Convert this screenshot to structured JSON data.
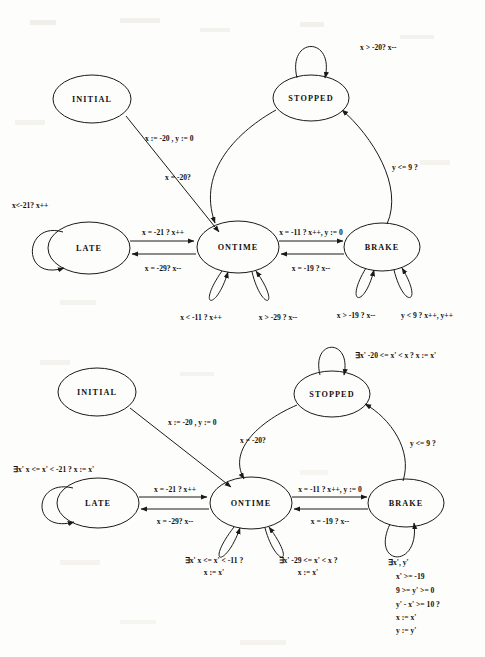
{
  "page": {
    "background_color": "#fdfdfb",
    "ink_color": "#1a1a1a"
  },
  "diagrams": [
    {
      "id": "top-diagram",
      "name": "concrete-timed-automaton",
      "states": [
        {
          "id": "initial",
          "label": "INITIAL",
          "cx": 92,
          "cy": 99,
          "rx": 39,
          "ry": 24
        },
        {
          "id": "stopped",
          "label": "STOPPED",
          "cx": 311,
          "cy": 98,
          "rx": 38,
          "ry": 23
        },
        {
          "id": "late",
          "label": "LATE",
          "cx": 89,
          "cy": 248,
          "rx": 41,
          "ry": 26
        },
        {
          "id": "ontime",
          "label": "ONTIME",
          "cx": 238,
          "cy": 247,
          "rx": 41,
          "ry": 26
        },
        {
          "id": "brake",
          "label": "BRAKE",
          "cx": 382,
          "cy": 247,
          "rx": 38,
          "ry": 24
        }
      ],
      "transitions": [
        {
          "id": "initial-to-ontime",
          "label": "x := -20 , y := 0",
          "lx": 187,
          "ly": 137
        },
        {
          "id": "ontime-to-stopped",
          "label": "x = -20?",
          "lx": 186,
          "ly": 177
        },
        {
          "id": "brake-to-stopped",
          "label": "y <= 9 ?",
          "lx": 403,
          "ly": 166
        },
        {
          "id": "stopped-self",
          "label": "x > -20? x--",
          "lx": 360,
          "ly": 50
        },
        {
          "id": "late-to-ontime",
          "label": "x = -21 ? x++",
          "lx": 165,
          "ly": 232
        },
        {
          "id": "ontime-to-late",
          "label": "x = -29? x--",
          "lx": 165,
          "ly": 268
        },
        {
          "id": "ontime-to-brake",
          "label": "x = -11 ? x++, y := 0",
          "lx": 310,
          "ly": 235
        },
        {
          "id": "brake-to-ontime",
          "label": "x = -19 ? x--",
          "lx": 310,
          "ly": 268
        },
        {
          "id": "late-self",
          "label": "x<-21?  x++",
          "lx": 12,
          "ly": 206
        },
        {
          "id": "ontime-self-left",
          "label": "x < -11 ? x++",
          "lx": 200,
          "ly": 318
        },
        {
          "id": "ontime-self-right",
          "label": "x > -29 ? x--",
          "lx": 277,
          "ly": 318
        },
        {
          "id": "brake-self-left",
          "label": "x > -19 ? x--",
          "lx": 355,
          "ly": 316
        },
        {
          "id": "brake-self-right",
          "label": "y < 9 ? x++, y++",
          "lx": 425,
          "ly": 316
        }
      ]
    },
    {
      "id": "bottom-diagram",
      "name": "abstract-timed-automaton",
      "states": [
        {
          "id": "initial",
          "label": "INITIAL",
          "cx": 97,
          "cy": 392,
          "rx": 39,
          "ry": 24
        },
        {
          "id": "stopped",
          "label": "STOPPED",
          "cx": 332,
          "cy": 394,
          "rx": 38,
          "ry": 23
        },
        {
          "id": "late",
          "label": "LATE",
          "cx": 98,
          "cy": 503,
          "rx": 41,
          "ry": 25
        },
        {
          "id": "ontime",
          "label": "ONTIME",
          "cx": 251,
          "cy": 503,
          "rx": 41,
          "ry": 26
        },
        {
          "id": "brake",
          "label": "BRAKE",
          "cx": 406,
          "cy": 503,
          "rx": 38,
          "ry": 24
        }
      ],
      "transitions": [
        {
          "id": "initial-to-ontime",
          "label": "x := -20 , y := 0",
          "lx": 200,
          "ly": 423
        },
        {
          "id": "ontime-to-stopped",
          "label": "x = -20?",
          "lx": 196,
          "ly": 441
        },
        {
          "id": "brake-to-stopped",
          "label": "y <= 9 ?",
          "lx": 428,
          "ly": 444
        },
        {
          "id": "stopped-self",
          "label": "∃x'  -20 <= x' < x ?  x := x'",
          "lx": 397,
          "ly": 357
        },
        {
          "id": "late-to-ontime",
          "label": "x = -21 ? x++",
          "lx": 177,
          "ly": 491
        },
        {
          "id": "ontime-to-late",
          "label": "x = -29? x--",
          "lx": 177,
          "ly": 522
        },
        {
          "id": "ontime-to-brake",
          "label": "x = -11 ? x++, y := 0",
          "lx": 329,
          "ly": 492
        },
        {
          "id": "brake-to-ontime",
          "label": "x = -19 ? x--",
          "lx": 329,
          "ly": 522
        },
        {
          "id": "late-self",
          "label": "∃x'  x <= x' < -21 ?  x := x'",
          "lx": 14,
          "ly": 470
        },
        {
          "id": "ontime-self-left-1",
          "label": "∃x'  x <= x' < -11 ?",
          "lx": 213,
          "ly": 561
        },
        {
          "id": "ontime-self-left-2",
          "label": "x := x'",
          "lx": 213,
          "ly": 573
        },
        {
          "id": "ontime-self-right-1",
          "label": "∃x'  -29 <= x' < x ?",
          "lx": 307,
          "ly": 561
        },
        {
          "id": "ontime-self-right-2",
          "label": "x := x'",
          "lx": 307,
          "ly": 573
        },
        {
          "id": "brake-self-1",
          "label": "∃x', y'",
          "lx": 397,
          "ly": 563
        },
        {
          "id": "brake-self-2",
          "label": "x' >= -19",
          "lx": 404,
          "ly": 577
        },
        {
          "id": "brake-self-3",
          "label": "9 >= y' >= 0",
          "lx": 404,
          "ly": 591
        },
        {
          "id": "brake-self-4",
          "label": "y' - x' >= 10 ?",
          "lx": 404,
          "ly": 605
        },
        {
          "id": "brake-self-5",
          "label": "x := x'",
          "lx": 404,
          "ly": 618
        },
        {
          "id": "brake-self-6",
          "label": "y := y'",
          "lx": 404,
          "ly": 631
        }
      ]
    }
  ]
}
